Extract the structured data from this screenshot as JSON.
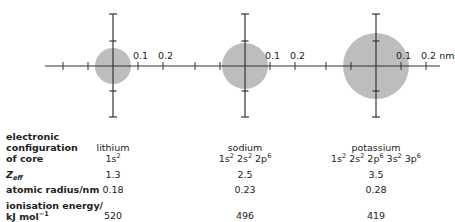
{
  "diagram": {
    "axis_unit": "nm",
    "scale_px_per_0_1nm": 25,
    "colors": {
      "circle_fill": "#bdbdbd",
      "axis": "#333333",
      "text": "#222222"
    },
    "atoms": [
      {
        "name": "lithium",
        "center_x": 113,
        "radius_px": 18,
        "core_config": [
          "1s",
          "2"
        ],
        "config_parts": [
          {
            "orb": "1s",
            "e": "2"
          }
        ],
        "zeff": "1.3",
        "atomic_radius_nm": "0.18",
        "ionisation_energy": "520",
        "tick_labels": [
          "0.1",
          "0.2"
        ]
      },
      {
        "name": "sodium",
        "center_x": 245,
        "radius_px": 23,
        "config_parts": [
          {
            "orb": "1s",
            "e": "2"
          },
          {
            "orb": "2s",
            "e": "2"
          },
          {
            "orb": "2p",
            "e": "6"
          }
        ],
        "zeff": "2.5",
        "atomic_radius_nm": "0.23",
        "ionisation_energy": "496",
        "tick_labels": [
          "0.1",
          "0.2"
        ]
      },
      {
        "name": "potassium",
        "center_x": 376,
        "radius_px": 33,
        "config_parts": [
          {
            "orb": "1s",
            "e": "2"
          },
          {
            "orb": "2s",
            "e": "2"
          },
          {
            "orb": "2p",
            "e": "6"
          },
          {
            "orb": "3s",
            "e": "2"
          },
          {
            "orb": "3p",
            "e": "6"
          }
        ],
        "zeff": "3.5",
        "atomic_radius_nm": "0.28",
        "ionisation_energy": "419",
        "tick_labels": [
          "0.1",
          "0.2 nm"
        ]
      }
    ]
  },
  "table": {
    "row_labels": {
      "config_line1": "electronic",
      "config_line2": "configuration",
      "config_line3": "of core",
      "zeff_main": "Z",
      "zeff_sub": "eff",
      "radius": "atomic radius/nm",
      "ie_line1": "ionisation energy/",
      "ie_line2": "kJ mol",
      "ie_sup": "−1"
    },
    "columns": [
      {
        "name": "lithium",
        "config": "1s2",
        "zeff": "1.3",
        "radius": "0.18",
        "ie": "520"
      },
      {
        "name": "sodium",
        "config": "1s2 2s2 2p6",
        "zeff": "2.5",
        "radius": "0.23",
        "ie": "496"
      },
      {
        "name": "potassium",
        "config": "1s2 2s2 2p6 3s2 3p6",
        "zeff": "3.5",
        "radius": "0.28",
        "ie": "419"
      }
    ]
  }
}
